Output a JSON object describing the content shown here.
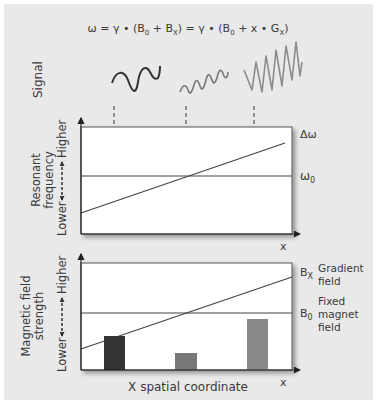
{
  "equation": {
    "lhs": "ω = γ • (B",
    "b0_sub": "0",
    "mid1": " + B",
    "bx_sub": "X",
    "mid2": ") = γ • (B",
    "b0_sub2": "0",
    "mid3": " + x • G",
    "gx_sub": "X",
    "end": ")"
  },
  "signal_row": {
    "label": "Signal",
    "waves": [
      {
        "name": "low-frequency",
        "color": "#333333"
      },
      {
        "name": "medium-frequency",
        "color": "#777777"
      },
      {
        "name": "high-frequency",
        "color": "#8c8c8c"
      }
    ]
  },
  "panel_frequency": {
    "ylabel_line1": "Resonant",
    "ylabel_line2": "frequency",
    "axis_low": "Lower",
    "axis_high": "Higher",
    "xlabel": "x",
    "delta_omega_label": "Δω",
    "omega0_label": "ω",
    "omega0_sub": "0"
  },
  "panel_field": {
    "ylabel_line1": "Magnetic field",
    "ylabel_line2": "strength",
    "axis_low": "Lower",
    "axis_high": "Higher",
    "xlabel": "x",
    "bx_label": "B",
    "bx_sub": "X",
    "gradient_line1": "Gradient",
    "gradient_line2": "field",
    "b0_label": "B",
    "b0_sub": "0",
    "fixed_line1": "Fixed",
    "fixed_line2": "magnet",
    "fixed_line3": "field",
    "bottom_label": "X spatial coordinate",
    "bars": [
      {
        "name": "bar-left",
        "color": "#333333",
        "relative_height": 0.31
      },
      {
        "name": "bar-middle",
        "color": "#777777",
        "relative_height": 0.15
      },
      {
        "name": "bar-right",
        "color": "#888888",
        "relative_height": 0.47
      }
    ]
  },
  "colors": {
    "background": "#e9e9e9",
    "panel": "#ffffff",
    "line": "#444444"
  }
}
